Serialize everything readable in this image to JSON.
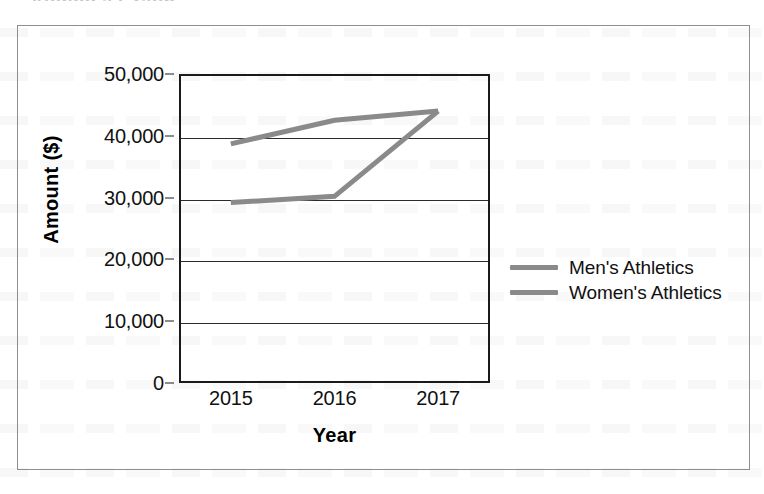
{
  "page": {
    "clipped_heading": "Adding a Graph",
    "background": "#ffffff"
  },
  "chart_data": {
    "type": "line",
    "title": "",
    "subtitle": "",
    "xlabel": "Year",
    "ylabel": "Amount ($)",
    "categories": [
      "2015",
      "2016",
      "2017"
    ],
    "series": [
      {
        "name": "Men's Athletics",
        "values": [
          38700,
          42500,
          44000
        ],
        "color": "#8a8a8a"
      },
      {
        "name": "Women's Athletics",
        "values": [
          29200,
          30200,
          44000
        ],
        "color": "#8a8a8a"
      }
    ],
    "ylim": [
      0,
      50000
    ],
    "y_ticks": [
      0,
      10000,
      20000,
      30000,
      40000,
      50000
    ],
    "y_tick_labels": [
      "0",
      "10,000",
      "20,000",
      "30,000",
      "40,000",
      "50,000"
    ],
    "grid": true,
    "grid_axis": "y",
    "legend_position": "right",
    "legend_entries": [
      "Men's Athletics",
      "Women's Athletics"
    ],
    "axis_color": "#1a1a1a",
    "grid_color": "#2a2a2a",
    "frame_color": "#8d8d92",
    "plot_background": "#ffffff"
  }
}
